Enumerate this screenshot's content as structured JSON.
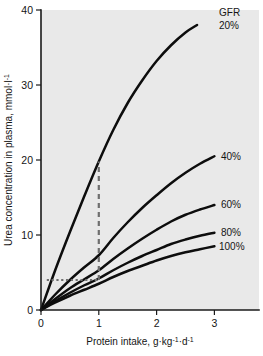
{
  "chart_data": {
    "type": "line",
    "title": "",
    "xlabel": "Protein intake, g·kg⁻¹·d⁻¹",
    "ylabel": "Urea concentration in plasma, mmol·l⁻¹",
    "xlim": [
      0,
      3.2
    ],
    "ylim": [
      0,
      40
    ],
    "xticks": [
      0,
      1,
      2,
      3
    ],
    "xticklabels": [
      "0",
      "1",
      "2",
      "3"
    ],
    "yticks": [
      0,
      10,
      20,
      30,
      40
    ],
    "yticklabels": [
      "0",
      "10",
      "20",
      "30",
      "40"
    ],
    "grid": false,
    "legend_position": "right-inline",
    "legend_title": "GFR",
    "series": [
      {
        "name": "20%",
        "label": "20%",
        "x": [
          0,
          0.25,
          0.5,
          0.75,
          1.0,
          1.25,
          1.5,
          1.75,
          2.0,
          2.25,
          2.5,
          2.7
        ],
        "values": [
          0,
          5.4,
          10.4,
          15.2,
          19.8,
          24.0,
          27.6,
          30.6,
          33.2,
          35.3,
          37.0,
          38.0
        ]
      },
      {
        "name": "40%",
        "label": "40%",
        "x": [
          0,
          0.25,
          0.5,
          0.75,
          1.0,
          1.25,
          1.5,
          1.75,
          2.0,
          2.25,
          2.5,
          2.75,
          3.0
        ],
        "values": [
          0,
          2.1,
          4.0,
          5.7,
          7.3,
          9.6,
          11.7,
          13.6,
          15.3,
          16.9,
          18.3,
          19.5,
          20.5
        ]
      },
      {
        "name": "60%",
        "label": "60%",
        "x": [
          0,
          0.25,
          0.5,
          0.75,
          1.0,
          1.25,
          1.5,
          1.75,
          2.0,
          2.25,
          2.5,
          2.75,
          3.0
        ],
        "values": [
          0,
          1.5,
          2.9,
          4.1,
          5.3,
          6.8,
          8.2,
          9.5,
          10.7,
          11.8,
          12.7,
          13.4,
          14.0
        ]
      },
      {
        "name": "80%",
        "label": "80%",
        "x": [
          0,
          0.25,
          0.5,
          0.75,
          1.0,
          1.25,
          1.5,
          1.75,
          2.0,
          2.25,
          2.5,
          2.75,
          3.0
        ],
        "values": [
          0,
          1.2,
          2.3,
          3.3,
          4.2,
          5.3,
          6.3,
          7.2,
          8.0,
          8.8,
          9.4,
          9.9,
          10.3
        ]
      },
      {
        "name": "100%",
        "label": "100%",
        "x": [
          0,
          0.25,
          0.5,
          0.75,
          1.0,
          1.25,
          1.5,
          1.75,
          2.0,
          2.25,
          2.5,
          2.75,
          3.0
        ],
        "values": [
          0,
          1.0,
          1.9,
          2.7,
          3.5,
          4.4,
          5.2,
          5.9,
          6.6,
          7.2,
          7.7,
          8.1,
          8.5
        ]
      }
    ],
    "annotations": [
      {
        "name": "vertical-guide",
        "style": "dashed",
        "x": 1.0,
        "y_from": 4.0,
        "y_to": 19.8,
        "color": "#6f6f6f"
      },
      {
        "name": "horizontal-guide",
        "style": "dotted",
        "y": 4.0,
        "x_from": 0.1,
        "x_to": 1.0,
        "color": "#6f6f6f"
      }
    ],
    "colors": {
      "plot_background": "#e9e9e9",
      "page_background": "#ffffff",
      "curve": "#0d0d0d",
      "axis": "#1a1a1a",
      "guide": "#6f6f6f"
    }
  },
  "axes": {
    "x_title_prefix": "Protein intake, g",
    "x_title_sep1": "·kg",
    "x_title_sup1": "-1",
    "x_title_sep2": "·d",
    "x_title_sup2": "-1",
    "y_title_prefix": "Urea concentration in plasma, mmol",
    "y_title_sep1": "·l",
    "y_title_sup1": "-1"
  },
  "legend": {
    "title": "GFR",
    "entries": [
      "20%",
      "40%",
      "60%",
      "80%",
      "100%"
    ]
  }
}
